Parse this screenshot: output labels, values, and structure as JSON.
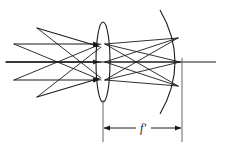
{
  "figure": {
    "type": "optical-ray-diagram",
    "background_color": "#ffffff",
    "stroke_color": "#1a1a1a",
    "labels": {
      "focal_length": "f'"
    },
    "geometry": {
      "canvas": {
        "width": 228,
        "height": 151
      },
      "optical_axis": {
        "y": 62,
        "x_start": 6,
        "x_end": 216
      },
      "lens": {
        "center_x": 103,
        "center_y": 62,
        "rx": 7,
        "ry": 40,
        "name": "converging-lens"
      },
      "mirror": {
        "vertex_x": 182,
        "vertex_y": 62,
        "top_x": 160,
        "top_y": 12,
        "bottom_x": 160,
        "bottom_y": 112,
        "name": "concave-mirror"
      },
      "dimension": {
        "y": 128,
        "x_left": 103,
        "x_right": 182,
        "label_x": 143,
        "label_y": 131
      }
    },
    "rays": {
      "incoming": [
        {
          "name": "oblique-upper",
          "x1": 37,
          "y1": 28,
          "x2": 101,
          "y2": 47
        },
        {
          "name": "parallel-upper",
          "x1": 14,
          "y1": 44,
          "x2": 101,
          "y2": 44
        },
        {
          "name": "parallel-axis",
          "x1": 6,
          "y1": 62,
          "x2": 101,
          "y2": 62
        },
        {
          "name": "parallel-lower",
          "x1": 14,
          "y1": 80,
          "x2": 101,
          "y2": 80
        },
        {
          "name": "oblique-lower",
          "x1": 37,
          "y1": 97,
          "x2": 101,
          "y2": 78
        }
      ],
      "crossing_left": [
        {
          "name": "cross-a",
          "x1": 14,
          "y1": 44,
          "x2": 101,
          "y2": 80
        },
        {
          "name": "cross-b",
          "x1": 14,
          "y1": 80,
          "x2": 101,
          "y2": 44
        },
        {
          "name": "cross-c",
          "x1": 37,
          "y1": 28,
          "x2": 101,
          "y2": 78
        },
        {
          "name": "cross-d",
          "x1": 37,
          "y1": 97,
          "x2": 101,
          "y2": 47
        }
      ],
      "outgoing": [
        {
          "name": "out-1",
          "x1": 103,
          "y1": 44,
          "x2": 178,
          "y2": 38
        },
        {
          "name": "out-2",
          "x1": 103,
          "y1": 44,
          "x2": 180,
          "y2": 62
        },
        {
          "name": "out-3",
          "x1": 103,
          "y1": 44,
          "x2": 178,
          "y2": 86
        },
        {
          "name": "out-4",
          "x1": 103,
          "y1": 62,
          "x2": 178,
          "y2": 38
        },
        {
          "name": "out-5",
          "x1": 103,
          "y1": 62,
          "x2": 180,
          "y2": 62
        },
        {
          "name": "out-6",
          "x1": 103,
          "y1": 62,
          "x2": 178,
          "y2": 86
        },
        {
          "name": "out-7",
          "x1": 103,
          "y1": 80,
          "x2": 178,
          "y2": 38
        },
        {
          "name": "out-8",
          "x1": 103,
          "y1": 80,
          "x2": 180,
          "y2": 62
        },
        {
          "name": "out-9",
          "x1": 103,
          "y1": 80,
          "x2": 178,
          "y2": 86
        }
      ]
    }
  }
}
